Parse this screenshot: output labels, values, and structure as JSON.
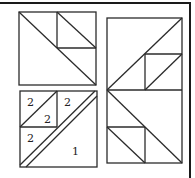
{
  "colors": {
    "line": "#2b2b2b",
    "frame": "#1a1a1a",
    "background": "#ffffff"
  },
  "diagram": {
    "top_left_block": {
      "label": ""
    },
    "bottom_left_block": {
      "labels": [
        {
          "id": "top-left-upper",
          "text": "2"
        },
        {
          "id": "top-left-lower",
          "text": "2"
        },
        {
          "id": "top-right",
          "text": "2"
        },
        {
          "id": "bottom-left",
          "text": "2"
        },
        {
          "id": "large-triangle",
          "text": "1"
        }
      ]
    },
    "right_block": {
      "label": ""
    }
  }
}
